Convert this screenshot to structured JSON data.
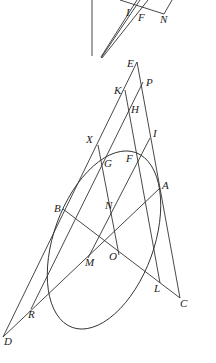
{
  "diagram": {
    "type": "geometry",
    "inset_labels": {
      "I": {
        "label": "I",
        "x": 83,
        "y": 16
      },
      "F": {
        "label": "F",
        "x": 93,
        "y": 21
      },
      "N": {
        "label": "N",
        "x": 160,
        "y": 23
      }
    },
    "points": {
      "E": {
        "label": "E",
        "x": 137,
        "y": 62,
        "lx": 127,
        "ly": 67
      },
      "P": {
        "label": "P",
        "x": 143,
        "y": 82,
        "lx": 146,
        "ly": 86
      },
      "K": {
        "label": "K",
        "x": 125,
        "y": 90,
        "lx": 114,
        "ly": 94
      },
      "H": {
        "label": "H",
        "x": 130,
        "y": 114,
        "lx": 131,
        "ly": 113
      },
      "I": {
        "label": "I",
        "x": 150,
        "y": 138,
        "lx": 153,
        "ly": 137
      },
      "X": {
        "label": "X",
        "x": 98,
        "y": 145,
        "lx": 86,
        "ly": 143
      },
      "G": {
        "label": "G",
        "x": 107,
        "y": 161,
        "lx": 104,
        "ly": 167
      },
      "F": {
        "label": "F",
        "x": 135,
        "y": 152,
        "lx": 126,
        "ly": 162
      },
      "A": {
        "label": "A",
        "x": 160,
        "y": 188,
        "lx": 162,
        "ly": 189
      },
      "B": {
        "label": "B",
        "x": 63,
        "y": 209,
        "lx": 54,
        "ly": 212
      },
      "N": {
        "label": "N",
        "x": 106,
        "y": 204,
        "lx": 105,
        "ly": 209
      },
      "O": {
        "label": "O",
        "x": 119,
        "y": 255,
        "lx": 109,
        "ly": 260
      },
      "M": {
        "label": "M",
        "x": 88,
        "y": 258,
        "lx": 85,
        "ly": 266
      },
      "L": {
        "label": "L",
        "x": 160,
        "y": 283,
        "lx": 154,
        "ly": 292
      },
      "C": {
        "label": "C",
        "x": 180,
        "y": 298,
        "lx": 180,
        "ly": 307
      },
      "R": {
        "label": "R",
        "x": 31,
        "y": 309,
        "lx": 28,
        "ly": 318
      },
      "D": {
        "label": "D",
        "x": 3,
        "y": 337,
        "lx": 4,
        "ly": 345
      }
    }
  }
}
